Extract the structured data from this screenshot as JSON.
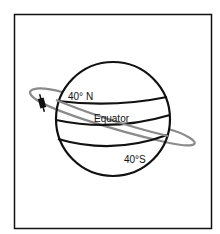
{
  "diagram": {
    "labels": {
      "north": "40° N",
      "equator": "Equator",
      "south": "40°S"
    },
    "colors": {
      "line": "#111111",
      "orbit": "#8a8a8a",
      "background": "#ffffff"
    }
  }
}
